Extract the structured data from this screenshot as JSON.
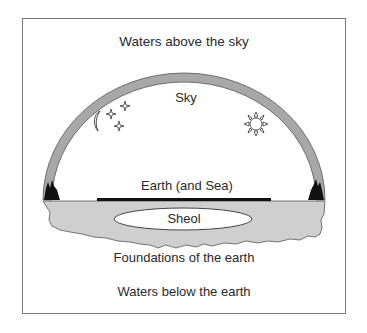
{
  "diagram": {
    "labels": {
      "waters_above": "Waters above the sky",
      "sky": "Sky",
      "earth": "Earth (and Sea)",
      "sheol": "Sheol",
      "foundations": "Foundations of the earth",
      "waters_below": "Waters below the earth"
    },
    "icons": [
      "moon-icon",
      "star-icon",
      "star-icon",
      "star-icon",
      "sun-icon",
      "mountain-icon",
      "mountain-icon"
    ],
    "colors": {
      "dome": "#a8a8a8",
      "earth_slab": "#cfcfcf",
      "outline": "#555555",
      "mountains": "#111111",
      "earth_bar": "#111111",
      "text": "#2a2a2a"
    }
  }
}
